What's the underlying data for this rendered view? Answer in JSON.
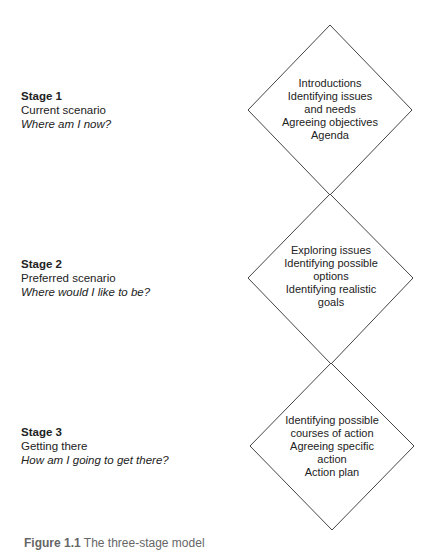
{
  "stages": [
    {
      "title": "Stage 1",
      "name": "Current scenario",
      "question": "Where am I now?",
      "activities": [
        "Introductions",
        "Identifying issues",
        "and needs",
        "Agreeing objectives",
        "Agenda"
      ]
    },
    {
      "title": "Stage 2",
      "name": "Preferred scenario",
      "question": "Where would I like to be?",
      "activities": [
        "Exploring issues",
        "Identifying possible",
        "options",
        "Identifying realistic",
        "goals"
      ]
    },
    {
      "title": "Stage 3",
      "name": "Getting there",
      "question": "How am I going to get there?",
      "activities": [
        "Identifying possible",
        "courses of action",
        "Agreeing specific",
        "action",
        "Action plan"
      ]
    }
  ],
  "caption": {
    "label": "Figure 1.1",
    "text": "The three-stage model"
  },
  "colors": {
    "line": "#444444",
    "text": "#222222"
  }
}
